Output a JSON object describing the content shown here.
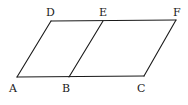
{
  "diagram": {
    "type": "geometry",
    "stroke_color": "#1a1a1a",
    "background": "#ffffff",
    "points": {
      "A": {
        "label": "A",
        "x": 17,
        "y": 77,
        "lx": 9,
        "ly": 92
      },
      "B": {
        "label": "B",
        "x": 69,
        "y": 77,
        "lx": 62,
        "ly": 92
      },
      "C": {
        "label": "C",
        "x": 144,
        "y": 76,
        "lx": 137,
        "ly": 92
      },
      "D": {
        "label": "D",
        "x": 51,
        "y": 21,
        "lx": 46,
        "ly": 16
      },
      "E": {
        "label": "E",
        "x": 103,
        "y": 21,
        "lx": 99,
        "ly": 16
      },
      "F": {
        "label": "F",
        "x": 176,
        "y": 20,
        "lx": 173,
        "ly": 16
      }
    },
    "segments": [
      [
        "A",
        "C"
      ],
      [
        "D",
        "F"
      ],
      [
        "A",
        "D"
      ],
      [
        "B",
        "E"
      ],
      [
        "C",
        "F"
      ]
    ]
  }
}
